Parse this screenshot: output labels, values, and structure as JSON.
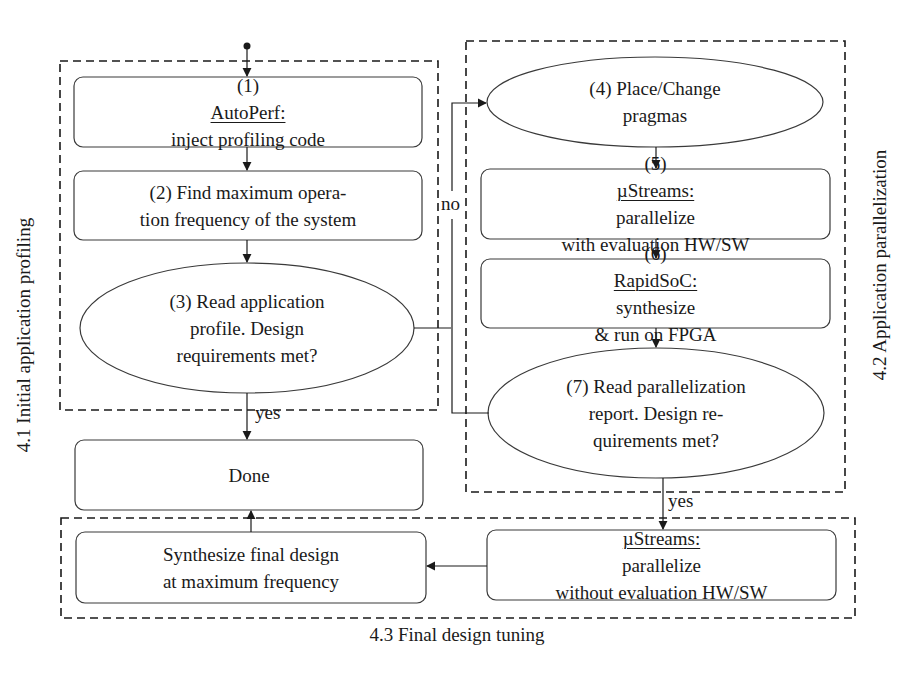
{
  "diagram": {
    "type": "flowchart",
    "colors": {
      "stroke": "#3a3a3a",
      "text": "#1a1a1a",
      "background": "#ffffff"
    },
    "groups": [
      {
        "id": "g41",
        "label": "4.1 Initial application profiling",
        "orientation": "vertical-left"
      },
      {
        "id": "g42",
        "label": "4.2 Application parallelization",
        "orientation": "vertical-right"
      },
      {
        "id": "g43",
        "label": "4.3 Final design tuning",
        "orientation": "bottom"
      }
    ],
    "nodes": {
      "n1": {
        "shape": "rounded-rect",
        "prefix": "(1) ",
        "tool": "AutoPerf:",
        "lines": [
          "inject profiling code"
        ]
      },
      "n2": {
        "shape": "rounded-rect",
        "lines": [
          "(2) Find maximum opera-",
          "tion frequency of the system"
        ]
      },
      "n3": {
        "shape": "ellipse",
        "lines": [
          "(3) Read application",
          "profile. Design",
          "requirements met?"
        ]
      },
      "n4": {
        "shape": "ellipse",
        "lines": [
          "(4) Place/Change",
          "pragmas"
        ]
      },
      "n5": {
        "shape": "rounded-rect",
        "prefix": "(5) ",
        "tool": "µStreams:",
        "line1_rest": " parallelize",
        "line2": "with evaluation HW/SW"
      },
      "n6": {
        "shape": "rounded-rect",
        "prefix": "(6) ",
        "tool": "RapidSoC:",
        "line1_rest": " synthesize",
        "line2": "& run on FPGA"
      },
      "n7": {
        "shape": "ellipse",
        "lines": [
          "(7) Read parallelization",
          "report. Design re-",
          "quirements met?"
        ]
      },
      "done": {
        "shape": "rounded-rect",
        "lines": [
          "Done"
        ]
      },
      "synth": {
        "shape": "rounded-rect",
        "lines": [
          "Synthesize final design",
          "at maximum frequency"
        ]
      },
      "final_streams": {
        "shape": "rounded-rect",
        "tool": "µStreams:",
        "line1_rest": " parallelize",
        "line2": "without evaluation HW/SW"
      }
    },
    "edge_labels": {
      "no": "no",
      "yes_3": "yes",
      "yes_7": "yes"
    },
    "edges": [
      {
        "from": "start",
        "to": "n1"
      },
      {
        "from": "n1",
        "to": "n2"
      },
      {
        "from": "n2",
        "to": "n3"
      },
      {
        "from": "n3",
        "to": "done",
        "label": "yes"
      },
      {
        "from": "n3",
        "to": "n4",
        "label": "no"
      },
      {
        "from": "n7",
        "to": "n4",
        "label": "no"
      },
      {
        "from": "n4",
        "to": "n5"
      },
      {
        "from": "n5",
        "to": "n6"
      },
      {
        "from": "n6",
        "to": "n7"
      },
      {
        "from": "n7",
        "to": "final_streams",
        "label": "yes"
      },
      {
        "from": "final_streams",
        "to": "synth"
      },
      {
        "from": "synth",
        "to": "done"
      }
    ]
  }
}
